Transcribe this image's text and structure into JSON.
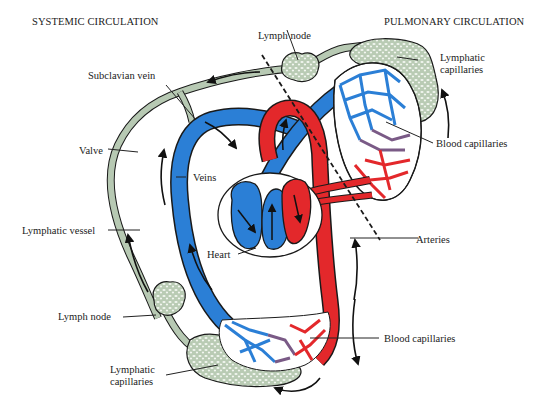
{
  "diagram": {
    "colors": {
      "vein": "#2b7fd6",
      "artery": "#e3282b",
      "mixed": "#7a5a86",
      "lymph": "#b7c9b3",
      "lymph_fill": "#d9e4d5",
      "outline": "#1a1a1a",
      "background": "#ffffff"
    },
    "titles": {
      "systemic": "SYSTEMIC CIRCULATION",
      "pulmonary": "PULMONARY CIRCULATION"
    },
    "labels": {
      "lymph_node_top": "Lymph node",
      "lymphatic_capillaries_top_line1": "Lymphatic",
      "lymphatic_capillaries_top_line2": "capillaries",
      "subclavian_vein": "Subclavian vein",
      "blood_capillaries_top": "Blood capillaries",
      "valve": "Valve",
      "veins": "Veins",
      "lymphatic_vessel": "Lymphatic vessel",
      "heart": "Heart",
      "arteries": "Arteries",
      "lymph_node_bottom": "Lymph node",
      "blood_capillaries_bottom": "Blood capillaries",
      "lymphatic_capillaries_bottom_line1": "Lymphatic",
      "lymphatic_capillaries_bottom_line2": "capillaries"
    }
  }
}
